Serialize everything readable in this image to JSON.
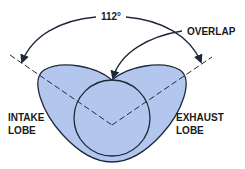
{
  "diagram": {
    "angle_label": "112°",
    "overlap_label": "OVERLAP",
    "intake_label": [
      "INTAKE",
      "LOBE"
    ],
    "exhaust_label": [
      "EXHAUST",
      "LOBE"
    ]
  },
  "colors": {
    "lobe_fill": "#b3c6ee",
    "stroke": "#1e2a3a",
    "background": "#ffffff"
  }
}
